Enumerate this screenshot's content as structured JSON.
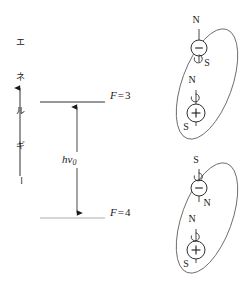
{
  "figure": {
    "background_color": "#ffffff",
    "line_color": "#1a1a1a"
  },
  "axis": {
    "name": "energy-axis",
    "label_text": "エネルギー",
    "label_chars": [
      "エ",
      "ネ",
      "ル",
      "ギ",
      "ー"
    ],
    "direction": "up",
    "arrow_from_y": 176,
    "arrow_to_y": 84,
    "x": 20
  },
  "levels": [
    {
      "id": "upper",
      "label_var": "F",
      "label_eq": "=",
      "label_value": "3",
      "label_full": "F = 3",
      "line_x1": 40,
      "line_x2": 105,
      "line_y": 102
    },
    {
      "id": "lower",
      "label_var": "F",
      "label_eq": "=",
      "label_value": "4",
      "label_full": "F = 4",
      "line_x1": 40,
      "line_x2": 105,
      "line_y": 218
    }
  ],
  "transition": {
    "name": "hyperfine-transition",
    "label_h": "h",
    "label_nu": "ν",
    "label_sub": "0",
    "label_full": "hν0",
    "arrow_x": 77,
    "arrow_top_y": 102,
    "arrow_bottom_y": 218,
    "double_headed": true
  },
  "atoms": [
    {
      "id": "atom-upper",
      "name": "atom-parallel-spins",
      "spin_configuration": "parallel",
      "orbit": {
        "cx": 207,
        "cy": 84,
        "rx": 25,
        "ry": 58,
        "rotation_deg": 20
      },
      "electron": {
        "symbol": "−",
        "charge": "negative",
        "cx": 199,
        "cy": 48,
        "r": 8,
        "pole_top": "N",
        "pole_bottom": "S",
        "pole_top_x": 195,
        "pole_top_y": 20,
        "pole_bottom_x": 206,
        "pole_bottom_y": 63,
        "spin_arrow": "clockwise"
      },
      "nucleus": {
        "symbol": "+",
        "charge": "positive",
        "cx": 196,
        "cy": 113,
        "r": 9,
        "pole_top": "N",
        "pole_bottom": "S",
        "pole_top_x": 191,
        "pole_top_y": 80,
        "pole_bottom_x": 185,
        "pole_bottom_y": 127,
        "spin_arrow": "clockwise"
      }
    },
    {
      "id": "atom-lower",
      "name": "atom-antiparallel-spins",
      "spin_configuration": "antiparallel",
      "orbit": {
        "cx": 207,
        "cy": 218,
        "rx": 25,
        "ry": 58,
        "rotation_deg": 20
      },
      "electron": {
        "symbol": "−",
        "charge": "negative",
        "cx": 199,
        "cy": 188,
        "r": 8,
        "pole_top": "S",
        "pole_bottom": "N",
        "pole_top_x": 195,
        "pole_top_y": 158,
        "pole_bottom_x": 206,
        "pole_bottom_y": 202,
        "spin_arrow": "clockwise"
      },
      "nucleus": {
        "symbol": "+",
        "charge": "positive",
        "cx": 196,
        "cy": 250,
        "r": 9,
        "pole_top": "N",
        "pole_bottom": "S",
        "pole_top_x": 191,
        "pole_top_y": 219,
        "pole_bottom_x": 185,
        "pole_bottom_y": 263,
        "spin_arrow": "clockwise"
      }
    }
  ]
}
